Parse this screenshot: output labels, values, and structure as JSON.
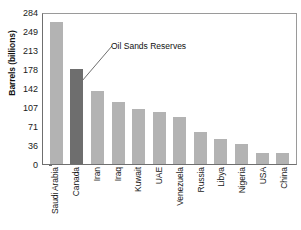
{
  "chart_data": {
    "type": "bar",
    "title": "",
    "xlabel": "",
    "ylabel": "Barrels (billions)",
    "categories": [
      "Saudi Arabia",
      "Canada",
      "Iran",
      "Iraq",
      "Kuwait",
      "UAE",
      "Venezuela",
      "Russia",
      "Libya",
      "Nigeria",
      "USA",
      "China"
    ],
    "values": [
      265,
      178,
      136,
      115,
      102,
      98,
      87,
      60,
      46,
      37,
      21,
      20
    ],
    "ylim": [
      0,
      284
    ],
    "yticks": [
      0,
      36,
      71,
      107,
      142,
      178,
      213,
      249,
      284
    ],
    "ytick_labels": [
      "0",
      "36",
      "71",
      "107",
      "142",
      "178",
      "213",
      "249",
      "284"
    ],
    "grid": false,
    "legend": "none",
    "annotations": [
      {
        "text": "Oil Sands Reserves",
        "target_category": "Canada"
      }
    ],
    "colors": {
      "bar": "#b3b3b3",
      "highlight_bar": "#6e6e6e",
      "axis": "#6f6f6f",
      "frame": "#9a9a9a",
      "text": "#1a1a1a",
      "background": "#ffffff"
    },
    "highlight_index": 1
  }
}
